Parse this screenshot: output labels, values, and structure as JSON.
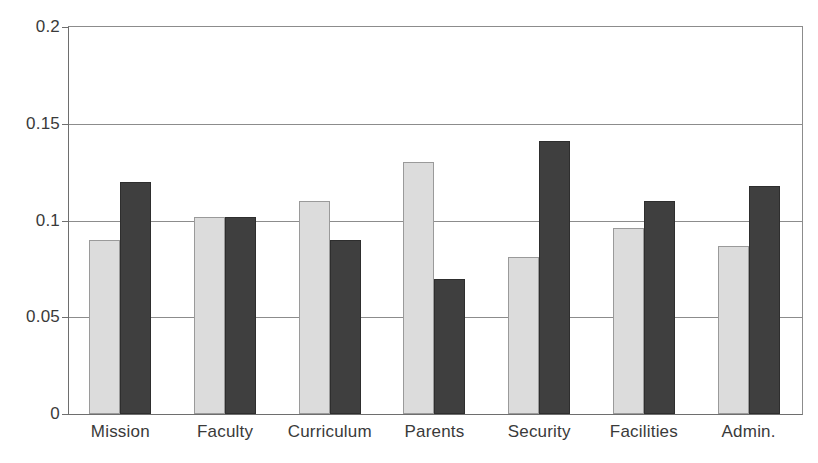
{
  "chart_data": {
    "type": "bar",
    "title": "",
    "subtitle": "",
    "xlabel": "",
    "ylabel": "",
    "categories": [
      "Mission",
      "Faculty",
      "Curriculum",
      "Parents",
      "Security",
      "Facilities",
      "Admin."
    ],
    "series": [
      {
        "name": "series-1",
        "color": "#dcdcdc",
        "values": [
          0.09,
          0.102,
          0.11,
          0.13,
          0.081,
          0.096,
          0.087
        ]
      },
      {
        "name": "series-2",
        "color": "#3f3f3f",
        "values": [
          0.12,
          0.102,
          0.09,
          0.07,
          0.141,
          0.11,
          0.118
        ]
      }
    ],
    "ylim": [
      0,
      0.2
    ],
    "yticks": [
      "0",
      "0.05",
      "0.1",
      "0.15",
      "0.2"
    ],
    "ytick_values": [
      0,
      0.05,
      0.1,
      0.15,
      0.2
    ],
    "grid": true,
    "grid_axis": "y",
    "legend": false,
    "legend_position": "none",
    "annotations": []
  },
  "axis_style": {
    "grid_color": "#8c8c8c",
    "axis_color": "#6e6e6e",
    "text_color": "#3a3a3a"
  }
}
